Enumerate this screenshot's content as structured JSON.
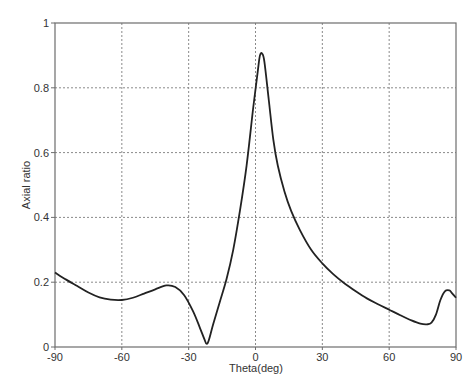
{
  "chart_data": {
    "type": "line",
    "title": "",
    "xlabel": "Theta(deg)",
    "ylabel": "Axial ratio",
    "xlim": [
      -90,
      90
    ],
    "ylim": [
      0,
      1
    ],
    "xticks": [
      -90,
      -60,
      -30,
      0,
      30,
      60,
      90
    ],
    "xtick_labels": [
      "-90",
      "-60",
      "-30",
      "0",
      "30",
      "60",
      "90"
    ],
    "yticks": [
      0,
      0.2,
      0.4,
      0.6,
      0.8,
      1
    ],
    "ytick_labels": [
      "0",
      "0.2",
      "0.4",
      "0.6",
      "0.8",
      "1"
    ],
    "grid": true,
    "legend": null,
    "series": [
      {
        "name": "Axial ratio",
        "color": "#222222",
        "x": [
          -90,
          -85,
          -80,
          -75,
          -70,
          -65,
          -60,
          -55,
          -50,
          -45,
          -40,
          -36,
          -32,
          -28,
          -25,
          -23,
          -22,
          -21,
          -19,
          -16,
          -13,
          -10,
          -7,
          -4,
          -1,
          1,
          2,
          3,
          4,
          6,
          8,
          10,
          13,
          16,
          20,
          25,
          30,
          35,
          40,
          45,
          50,
          55,
          60,
          65,
          70,
          74,
          77,
          79,
          81,
          83,
          85,
          87,
          88,
          89,
          90
        ],
        "y": [
          0.23,
          0.208,
          0.188,
          0.168,
          0.153,
          0.146,
          0.145,
          0.152,
          0.165,
          0.178,
          0.19,
          0.185,
          0.16,
          0.11,
          0.06,
          0.025,
          0.01,
          0.02,
          0.07,
          0.14,
          0.21,
          0.3,
          0.42,
          0.56,
          0.74,
          0.85,
          0.9,
          0.905,
          0.88,
          0.76,
          0.64,
          0.56,
          0.48,
          0.42,
          0.36,
          0.3,
          0.258,
          0.224,
          0.196,
          0.172,
          0.15,
          0.132,
          0.115,
          0.098,
          0.082,
          0.072,
          0.07,
          0.075,
          0.1,
          0.145,
          0.172,
          0.175,
          0.168,
          0.16,
          0.152
        ]
      }
    ]
  }
}
